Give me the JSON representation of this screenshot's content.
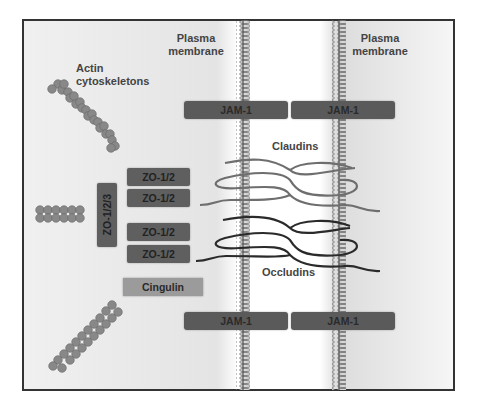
{
  "labels": {
    "plasma_membrane_left": "Plasma\nmembrane",
    "plasma_membrane_left_line1": "Plasma",
    "plasma_membrane_left_line2": "membrane",
    "plasma_membrane_right_line1": "Plasma",
    "plasma_membrane_right_line2": "membrane",
    "actin_line1": "Actin",
    "actin_line2": "cytoskeletons",
    "claudins": "Claudins",
    "occludins": "Occludins"
  },
  "proteins": {
    "jam_top": [
      "JAM-1",
      "JAM-1"
    ],
    "jam_bottom": [
      "JAM-1",
      "JAM-1"
    ],
    "zo12": [
      "ZO-1/2",
      "ZO-1/2",
      "ZO-1/2",
      "ZO-1/2"
    ],
    "zo123": "ZO-1/2/3",
    "cingulin": "Cingulin"
  },
  "colors": {
    "protein_box": "#5f5f5f",
    "cingulin_box": "#9b9b9b",
    "actin_bead": "#808080",
    "claudin_strand": "#6e6e6e",
    "occludin_strand": "#2a2a2a",
    "frame_border": "#333333"
  }
}
